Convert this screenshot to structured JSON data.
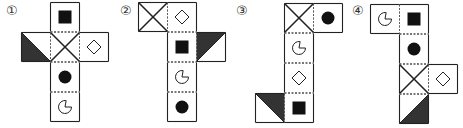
{
  "colors": {
    "stroke": "#222222",
    "fill": "#111111",
    "triangle": "#333333",
    "dashed": "#555555"
  },
  "cell_size": 29,
  "options": [
    {
      "label": "①",
      "label_pos": [
        6,
        4
      ],
      "cells": [
        {
          "x": 50,
          "y": 2,
          "symbol": "filled-square"
        },
        {
          "x": 21,
          "y": 32,
          "symbol": "triangle",
          "dark_corner": "bottom-left"
        },
        {
          "x": 50,
          "y": 32,
          "symbol": "x-cross"
        },
        {
          "x": 79,
          "y": 32,
          "symbol": "diamond"
        },
        {
          "x": 50,
          "y": 62,
          "symbol": "filled-circle"
        },
        {
          "x": 50,
          "y": 92,
          "symbol": "pie"
        }
      ]
    },
    {
      "label": "②",
      "label_pos": [
        120,
        4
      ],
      "cells": [
        {
          "x": 138,
          "y": 2,
          "symbol": "x-cross"
        },
        {
          "x": 167,
          "y": 2,
          "symbol": "diamond"
        },
        {
          "x": 167,
          "y": 32,
          "symbol": "filled-square"
        },
        {
          "x": 196,
          "y": 32,
          "symbol": "triangle",
          "dark_corner": "top-left"
        },
        {
          "x": 167,
          "y": 62,
          "symbol": "pie"
        },
        {
          "x": 167,
          "y": 92,
          "symbol": "filled-circle"
        }
      ]
    },
    {
      "label": "③",
      "label_pos": [
        236,
        4
      ],
      "cells": [
        {
          "x": 284,
          "y": 3,
          "symbol": "x-cross"
        },
        {
          "x": 313,
          "y": 3,
          "symbol": "filled-circle"
        },
        {
          "x": 284,
          "y": 33,
          "symbol": "pie"
        },
        {
          "x": 284,
          "y": 63,
          "symbol": "diamond"
        },
        {
          "x": 255,
          "y": 93,
          "symbol": "triangle",
          "dark_corner": "top-right"
        },
        {
          "x": 284,
          "y": 93,
          "symbol": "filled-square"
        }
      ]
    },
    {
      "label": "④",
      "label_pos": [
        352,
        4
      ],
      "cells": [
        {
          "x": 370,
          "y": 4,
          "symbol": "pie"
        },
        {
          "x": 399,
          "y": 4,
          "symbol": "filled-square"
        },
        {
          "x": 399,
          "y": 34,
          "symbol": "filled-circle"
        },
        {
          "x": 399,
          "y": 64,
          "symbol": "x-cross"
        },
        {
          "x": 428,
          "y": 64,
          "symbol": "diamond"
        },
        {
          "x": 399,
          "y": 94,
          "symbol": "triangle",
          "dark_corner": "bottom-right"
        }
      ]
    }
  ]
}
